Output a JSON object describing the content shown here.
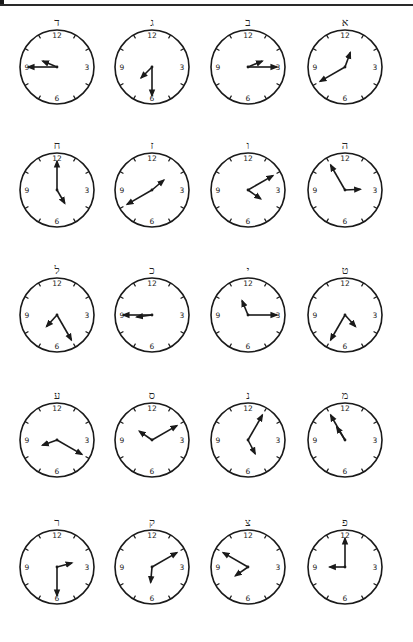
{
  "worksheet": {
    "description": "Clock-reading worksheet with Hebrew letter labels",
    "numerals": [
      "12",
      "3",
      "6",
      "9"
    ],
    "rows": [
      [
        {
          "label": "ד",
          "time": "9:45",
          "hour": 9,
          "minute": 45
        },
        {
          "label": "ג",
          "time": "7:30",
          "hour": 7,
          "minute": 30
        },
        {
          "label": "ב",
          "time": "2:15",
          "hour": 2,
          "minute": 15
        },
        {
          "label": "א",
          "time": "12:40",
          "hour": 12,
          "minute": 40
        }
      ],
      [
        {
          "label": "ח",
          "time": "5:00",
          "hour": 5,
          "minute": 0
        },
        {
          "label": "ז",
          "time": "1:40",
          "hour": 1,
          "minute": 40
        },
        {
          "label": "ו",
          "time": "4:10",
          "hour": 4,
          "minute": 10
        },
        {
          "label": "ה",
          "time": "2:55",
          "hour": 2,
          "minute": 55
        }
      ],
      [
        {
          "label": "ל",
          "time": "7:25",
          "hour": 7,
          "minute": 25
        },
        {
          "label": "כ",
          "time": "8:45",
          "hour": 8,
          "minute": 45
        },
        {
          "label": "י",
          "time": "11:15",
          "hour": 11,
          "minute": 15
        },
        {
          "label": "ט",
          "time": "4:35",
          "hour": 4,
          "minute": 35
        }
      ],
      [
        {
          "label": "ע",
          "time": "8:20",
          "hour": 8,
          "minute": 20
        },
        {
          "label": "ס",
          "time": "10:10",
          "hour": 10,
          "minute": 10
        },
        {
          "label": "נ",
          "time": "5:05",
          "hour": 5,
          "minute": 5
        },
        {
          "label": "מ",
          "time": "10:55",
          "hour": 10,
          "minute": 55
        }
      ],
      [
        {
          "label": "ר",
          "time": "2:30",
          "hour": 2,
          "minute": 30
        },
        {
          "label": "ק",
          "time": "6:10",
          "hour": 6,
          "minute": 10
        },
        {
          "label": "צ",
          "time": "7:50",
          "hour": 7,
          "minute": 50
        },
        {
          "label": "פ",
          "time": "9:00",
          "hour": 9,
          "minute": 0
        }
      ]
    ]
  }
}
